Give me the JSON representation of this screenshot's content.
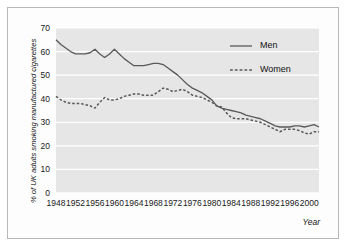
{
  "chart_data": {
    "type": "line",
    "title": "",
    "subtitle": "",
    "xlabel": "Year",
    "ylabel": "% of UK adults smoking manufactured cigarettes",
    "xlim": [
      1948,
      2002
    ],
    "ylim": [
      0,
      70
    ],
    "ytick_labels": [
      "0",
      "10",
      "20",
      "30",
      "40",
      "50",
      "60",
      "70"
    ],
    "yticks": [
      0,
      10,
      20,
      30,
      40,
      50,
      60,
      70
    ],
    "xtick_labels": [
      "1948",
      "1952",
      "1956",
      "1960",
      "1964",
      "1968",
      "1972",
      "1976",
      "1980",
      "1984",
      "1988",
      "1992",
      "1996",
      "2000"
    ],
    "xticks": [
      1948,
      1952,
      1956,
      1960,
      1964,
      1968,
      1972,
      1976,
      1980,
      1984,
      1988,
      1992,
      1996,
      2000
    ],
    "grid": "horizontal-white-on-gray",
    "legend_position": "top-right",
    "plot_background": "#e6e6e6",
    "gridline_color": "#ffffff",
    "line_color": "#595959",
    "x": [
      1948,
      1949,
      1950,
      1951,
      1952,
      1953,
      1954,
      1955,
      1956,
      1957,
      1958,
      1959,
      1960,
      1961,
      1962,
      1963,
      1964,
      1965,
      1966,
      1967,
      1968,
      1969,
      1970,
      1971,
      1972,
      1973,
      1974,
      1975,
      1976,
      1977,
      1978,
      1979,
      1980,
      1981,
      1982,
      1983,
      1984,
      1985,
      1986,
      1987,
      1988,
      1989,
      1990,
      1991,
      1992,
      1993,
      1994,
      1995,
      1996,
      1997,
      1998,
      1999,
      2000,
      2001,
      2002
    ],
    "series": [
      {
        "name": "Men",
        "style": "solid",
        "values": [
          65,
          63,
          61.5,
          60,
          59,
          59,
          59,
          59.5,
          61,
          59,
          57.5,
          59,
          61,
          59,
          57,
          55.5,
          54,
          54,
          54,
          54.5,
          55,
          55,
          54.5,
          53,
          51.5,
          50,
          48,
          46,
          44.5,
          43.5,
          42.5,
          41,
          39.5,
          37,
          36,
          35.5,
          35,
          34.5,
          34,
          33,
          32.5,
          32,
          31.5,
          30.5,
          29.5,
          28.5,
          28,
          28,
          28,
          28.5,
          28.5,
          28,
          28.5,
          29,
          28
        ]
      },
      {
        "name": "Women",
        "style": "dashed",
        "values": [
          41,
          39.5,
          38.5,
          38,
          38,
          38,
          37.5,
          37,
          36,
          38.5,
          40.5,
          39.5,
          39.5,
          40,
          41,
          41.5,
          42,
          42,
          41.5,
          41.5,
          41.5,
          43,
          44.5,
          44,
          43,
          43.5,
          44,
          43,
          41.5,
          41,
          40.5,
          39.5,
          38.5,
          37,
          36.5,
          34,
          32,
          31.5,
          31.5,
          31.5,
          31,
          30.5,
          30,
          29,
          28,
          27,
          26,
          27,
          27,
          27,
          26.5,
          25.5,
          25,
          26,
          26
        ]
      }
    ],
    "legend": [
      {
        "label": "Men",
        "style": "solid"
      },
      {
        "label": "Women",
        "style": "dashed"
      }
    ]
  }
}
